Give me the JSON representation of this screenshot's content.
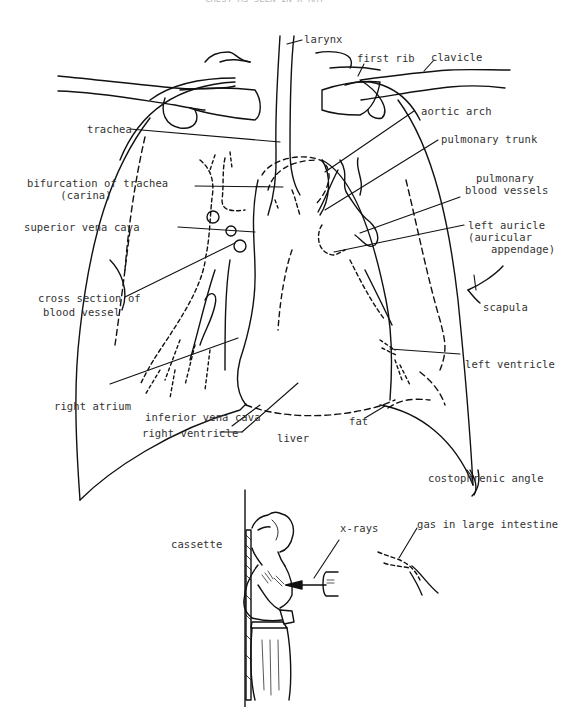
{
  "figure": {
    "title_fragment": "CHEST AS SEEN IN X-RAY",
    "colors": {
      "ink": "#111111",
      "label": "#333333",
      "background": "#ffffff"
    }
  },
  "labels": {
    "larynx": "larynx",
    "first_rib": "first rib",
    "clavicle": "clavicle",
    "trachea": "trachea",
    "aortic_arch": "aortic arch",
    "pulmonary_trunk": "pulmonary trunk",
    "bifurcation_line1": "bifurcation of trachea",
    "bifurcation_line2": "(carina)",
    "pulmonary_vessels_line1": "pulmonary",
    "pulmonary_vessels_line2": "blood vessels",
    "superior_vena_cava": "superior vena cava",
    "left_auricle_line1": "left auricle",
    "left_auricle_line2": "(auricular",
    "left_auricle_line3": "appendage)",
    "cross_section_line1": "cross section of",
    "cross_section_line2": "blood vessel",
    "scapula": "scapula",
    "left_ventricle": "left ventricle",
    "right_atrium": "right atrium",
    "inferior_vena_cava": "inferior vena cava",
    "fat": "fat",
    "right_ventricle": "right ventricle",
    "liver": "liver",
    "costophrenic_angle": "costophrenic angle"
  },
  "inset": {
    "cassette": "cassette",
    "x_rays": "x-rays",
    "gas_in_large_intestine": "gas in large intestine"
  }
}
